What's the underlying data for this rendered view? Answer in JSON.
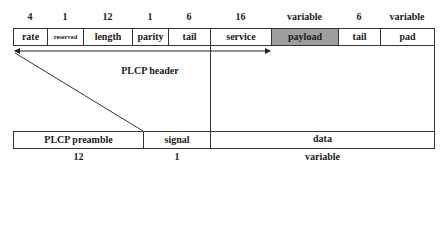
{
  "diagram": {
    "top_row": {
      "fields": [
        {
          "label": "rate",
          "bits": "4"
        },
        {
          "label": "reserved",
          "bits": "1"
        },
        {
          "label": "length",
          "bits": "12"
        },
        {
          "label": "parity",
          "bits": "1"
        },
        {
          "label": "tail",
          "bits": "6"
        },
        {
          "label": "service",
          "bits": "16"
        },
        {
          "label": "payload",
          "bits": "variable"
        },
        {
          "label": "tail",
          "bits": "6"
        },
        {
          "label": "pad",
          "bits": "variable"
        }
      ]
    },
    "header_arrow_label": "PLCP header",
    "bottom_row": {
      "fields": [
        {
          "label": "PLCP preamble",
          "size": "12"
        },
        {
          "label": "signal",
          "size": "1"
        },
        {
          "label": "data",
          "size": "variable"
        }
      ]
    },
    "colors": {
      "border": "#333333",
      "payload_fill": "#9e9e9e",
      "background": "#ffffff"
    }
  }
}
